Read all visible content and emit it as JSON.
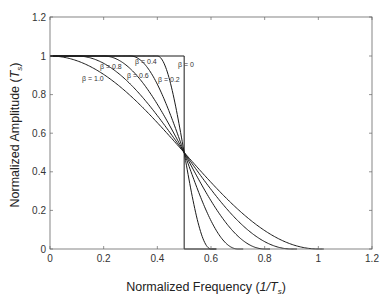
{
  "chart_data": {
    "type": "line",
    "title": "",
    "xlabel": "Normalized Frequency (1/T_s)",
    "xlabel_parts": {
      "main": "Normalized Frequency ",
      "open": "(",
      "italic": "1/T",
      "sub": "s",
      "close": ")"
    },
    "ylabel": "Normalized Amplitude (T_s)",
    "ylabel_parts": {
      "main": "Normalized Amplitude ",
      "open": "(",
      "italic": "T",
      "sub": "s",
      "close": ")"
    },
    "xlim": [
      0,
      1.2
    ],
    "ylim": [
      0,
      1.2
    ],
    "x_ticks": [
      0,
      0.2,
      0.4,
      0.6,
      0.8,
      1,
      1.2
    ],
    "x_tick_labels": [
      "0",
      "0.2",
      "0.4",
      "0.6",
      "0.8",
      "1",
      "1.2"
    ],
    "y_ticks": [
      0,
      0.2,
      0.4,
      0.6,
      0.8,
      1,
      1.2
    ],
    "y_tick_labels": [
      "0",
      "0.2",
      "0.4",
      "0.6",
      "0.8",
      "1",
      "1.2"
    ],
    "grid": false,
    "legend": "inline labels",
    "series": [
      {
        "name": "β = 0",
        "beta": 0.0,
        "label": "β = 0",
        "label_pos": [
          178,
          67
        ]
      },
      {
        "name": "β = 0.2",
        "beta": 0.2,
        "label": "β = 0.2",
        "label_pos": [
          158,
          82
        ]
      },
      {
        "name": "β = 0.4",
        "beta": 0.4,
        "label": "β = 0.4",
        "label_pos": [
          135,
          64
        ]
      },
      {
        "name": "β = 0.6",
        "beta": 0.6,
        "label": "β = 0.6",
        "label_pos": [
          127,
          78
        ]
      },
      {
        "name": "β = 0.8",
        "beta": 0.8,
        "label": "β = 0.8",
        "label_pos": [
          100,
          69
        ]
      },
      {
        "name": "β = 1.0",
        "beta": 1.0,
        "label": "β = 1.0",
        "label_pos": [
          82,
          81
        ]
      }
    ],
    "sample_points": {
      "x": [
        0,
        0.1,
        0.2,
        0.3,
        0.4,
        0.5,
        0.6,
        0.7,
        0.8,
        0.9,
        1.0
      ],
      "beta_1.0": [
        1,
        0.976,
        0.905,
        0.794,
        0.655,
        0.5,
        0.345,
        0.206,
        0.095,
        0.024,
        0
      ],
      "beta_0.6": [
        1,
        1,
        1,
        0.933,
        0.75,
        0.5,
        0.25,
        0.067,
        0,
        0,
        0
      ],
      "beta_0.2": [
        1,
        1,
        1,
        1,
        1,
        0.5,
        0,
        0,
        0,
        0,
        0
      ]
    }
  },
  "colors": {
    "line": "#1a1a1a",
    "axis": "#555555",
    "background": "#ffffff"
  }
}
